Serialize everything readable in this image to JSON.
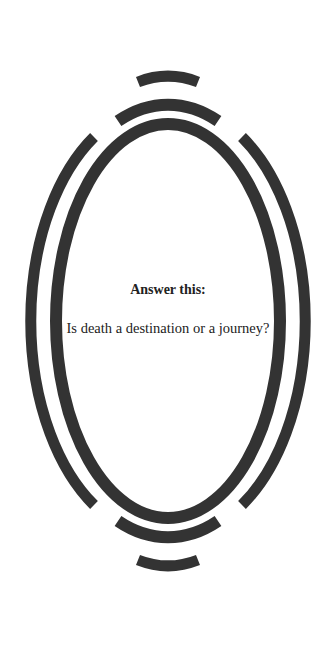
{
  "card": {
    "heading": "Answer this:",
    "question": "Is death a destination or a journey?"
  },
  "frame": {
    "stroke_color": "#333333",
    "background": "#ffffff",
    "ornament": "oval-mirror-frame"
  }
}
